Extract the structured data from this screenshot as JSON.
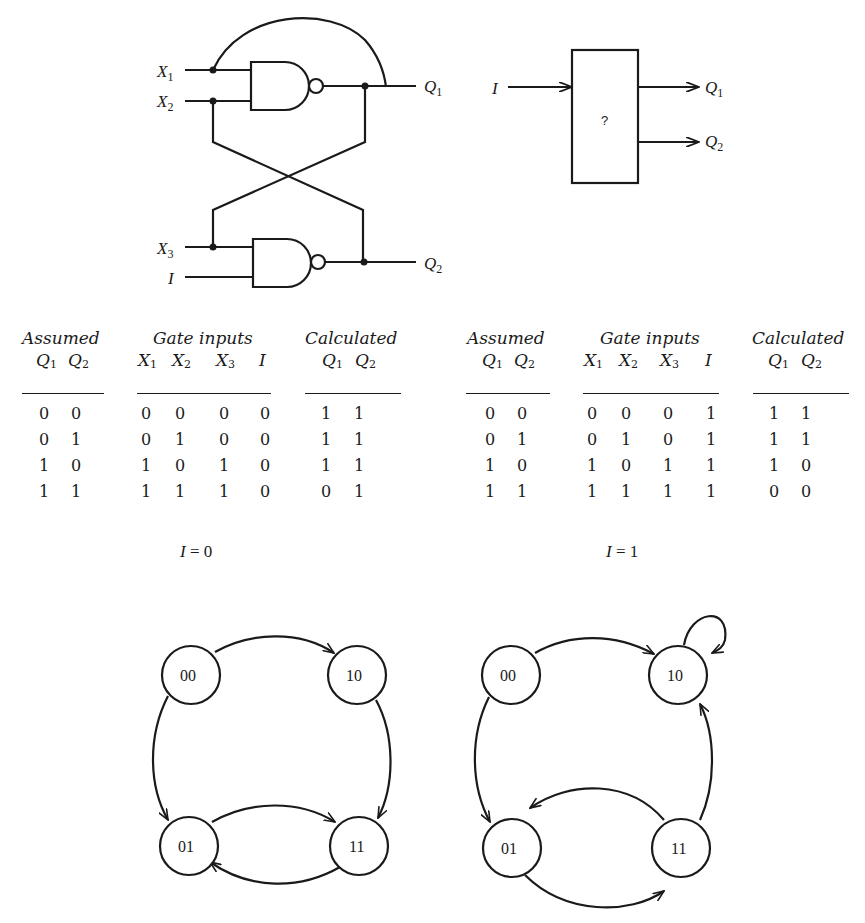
{
  "circuit": {
    "inputs": {
      "x1": "X",
      "x1_sub": "1",
      "x2": "X",
      "x2_sub": "2",
      "x3": "X",
      "x3_sub": "3",
      "i": "I"
    },
    "outputs": {
      "q1": "Q",
      "q1_sub": "1",
      "q2": "Q",
      "q2_sub": "2"
    },
    "gates": [
      "NAND",
      "NAND"
    ]
  },
  "black_box": {
    "input_label": "I",
    "body_label": "?",
    "outputs": [
      {
        "label": "Q",
        "sub": "1"
      },
      {
        "label": "Q",
        "sub": "2"
      }
    ]
  },
  "tables": [
    {
      "condition": {
        "var": "I",
        "eq": "=",
        "value": "0"
      },
      "headers": {
        "assumed": "Assumed",
        "gate_inputs": "Gate inputs",
        "calculated": "Calculated"
      },
      "subheaders": {
        "assumed": [
          {
            "v": "Q",
            "s": "1"
          },
          {
            "v": "Q",
            "s": "2"
          }
        ],
        "gate_inputs": [
          {
            "v": "X",
            "s": "1"
          },
          {
            "v": "X",
            "s": "2"
          },
          {
            "v": "X",
            "s": "3"
          },
          {
            "v": "I",
            "s": ""
          }
        ],
        "calculated": [
          {
            "v": "Q",
            "s": "1"
          },
          {
            "v": "Q",
            "s": "2"
          }
        ]
      },
      "rows": [
        {
          "assumed": [
            "0",
            "0"
          ],
          "inputs": [
            "0",
            "0",
            "0",
            "0"
          ],
          "calculated": [
            "1",
            "1"
          ]
        },
        {
          "assumed": [
            "0",
            "1"
          ],
          "inputs": [
            "0",
            "1",
            "0",
            "0"
          ],
          "calculated": [
            "1",
            "1"
          ]
        },
        {
          "assumed": [
            "1",
            "0"
          ],
          "inputs": [
            "1",
            "0",
            "1",
            "0"
          ],
          "calculated": [
            "1",
            "1"
          ]
        },
        {
          "assumed": [
            "1",
            "1"
          ],
          "inputs": [
            "1",
            "1",
            "1",
            "0"
          ],
          "calculated": [
            "0",
            "1"
          ]
        }
      ]
    },
    {
      "condition": {
        "var": "I",
        "eq": "=",
        "value": "1"
      },
      "headers": {
        "assumed": "Assumed",
        "gate_inputs": "Gate inputs",
        "calculated": "Calculated"
      },
      "subheaders": {
        "assumed": [
          {
            "v": "Q",
            "s": "1"
          },
          {
            "v": "Q",
            "s": "2"
          }
        ],
        "gate_inputs": [
          {
            "v": "X",
            "s": "1"
          },
          {
            "v": "X",
            "s": "2"
          },
          {
            "v": "X",
            "s": "3"
          },
          {
            "v": "I",
            "s": ""
          }
        ],
        "calculated": [
          {
            "v": "Q",
            "s": "1"
          },
          {
            "v": "Q",
            "s": "2"
          }
        ]
      },
      "rows": [
        {
          "assumed": [
            "0",
            "0"
          ],
          "inputs": [
            "0",
            "0",
            "0",
            "1"
          ],
          "calculated": [
            "1",
            "1"
          ]
        },
        {
          "assumed": [
            "0",
            "1"
          ],
          "inputs": [
            "0",
            "1",
            "0",
            "1"
          ],
          "calculated": [
            "1",
            "1"
          ]
        },
        {
          "assumed": [
            "1",
            "0"
          ],
          "inputs": [
            "1",
            "0",
            "1",
            "1"
          ],
          "calculated": [
            "1",
            "0"
          ]
        },
        {
          "assumed": [
            "1",
            "1"
          ],
          "inputs": [
            "1",
            "1",
            "1",
            "1"
          ],
          "calculated": [
            "0",
            "0"
          ]
        }
      ]
    }
  ],
  "state_diagrams": [
    {
      "condition": "I = 0",
      "states": [
        "00",
        "10",
        "01",
        "11"
      ],
      "transitions": [
        {
          "from": "00",
          "to": "10"
        },
        {
          "from": "10",
          "to": "11"
        },
        {
          "from": "00",
          "to": "01"
        },
        {
          "from": "01",
          "to": "11"
        },
        {
          "from": "11",
          "to": "01"
        }
      ]
    },
    {
      "condition": "I = 1",
      "states": [
        "00",
        "10",
        "01",
        "11"
      ],
      "transitions": [
        {
          "from": "00",
          "to": "10"
        },
        {
          "from": "10",
          "to": "10"
        },
        {
          "from": "00",
          "to": "01"
        },
        {
          "from": "11",
          "to": "10"
        },
        {
          "from": "11",
          "to": "01"
        },
        {
          "from": "01",
          "to": "11"
        }
      ]
    }
  ]
}
